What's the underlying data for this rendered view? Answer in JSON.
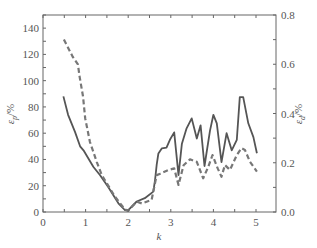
{
  "chart_data": {
    "type": "line",
    "title": "",
    "xlabel": "k",
    "ylabel_left": "εp/%",
    "ylabel_left_main": "ε",
    "ylabel_left_sub": "p",
    "ylabel_left_unit": "/%",
    "ylabel_right": "εd/%",
    "ylabel_right_main": "ε",
    "ylabel_right_sub": "d",
    "ylabel_right_unit": "/%",
    "xlim": [
      0,
      5.47
    ],
    "ylim_left": [
      0,
      150
    ],
    "ylim_right": [
      0,
      0.8
    ],
    "x_ticks": [
      0,
      1,
      2,
      3,
      4,
      5
    ],
    "x_tick_labels": [
      "0",
      "1",
      "2",
      "3",
      "4",
      "5"
    ],
    "y_left_ticks": [
      0,
      20,
      40,
      60,
      80,
      100,
      120,
      140
    ],
    "y_left_tick_labels": [
      "0",
      "20",
      "40",
      "60",
      "80",
      "100",
      "120",
      "140"
    ],
    "y_right_ticks": [
      0,
      0.2,
      0.4,
      0.6,
      0.8
    ],
    "y_right_tick_labels": [
      "0.0",
      "0.2",
      "0.4",
      "0.6",
      "0.8"
    ],
    "grid": false,
    "legend": null,
    "series": [
      {
        "name": "εp (left axis)",
        "axis": "left",
        "style": "solid",
        "color": "#555555",
        "x": [
          0.48,
          0.59,
          0.75,
          0.87,
          0.95,
          1.18,
          1.34,
          1.53,
          1.77,
          1.92,
          1.99,
          2.2,
          2.39,
          2.59,
          2.63,
          2.67,
          2.71,
          2.79,
          2.9,
          2.98,
          3.08,
          3.18,
          3.26,
          3.37,
          3.49,
          3.61,
          3.7,
          3.79,
          3.92,
          4.0,
          4.08,
          4.19,
          4.31,
          4.43,
          4.55,
          4.62,
          4.7,
          4.82,
          4.94,
          5.02
        ],
        "values": [
          88,
          74,
          61,
          50,
          47,
          34.5,
          28,
          19,
          6.6,
          1.5,
          1,
          8,
          10.5,
          15.5,
          24,
          36,
          44.6,
          48.5,
          49,
          55,
          60.6,
          28,
          52,
          63.7,
          71.3,
          56,
          66,
          35,
          62,
          74,
          67.5,
          38,
          60,
          47,
          55,
          87.5,
          87.5,
          67.5,
          57,
          44.7
        ]
      },
      {
        "name": "εd (right axis)",
        "axis": "right",
        "style": "dashed",
        "color": "#777777",
        "x": [
          0.49,
          0.7,
          0.82,
          0.86,
          0.94,
          0.99,
          1.1,
          1.26,
          1.38,
          1.45,
          1.69,
          1.92,
          2.0,
          2.2,
          2.32,
          2.55,
          2.63,
          2.67,
          2.75,
          2.94,
          3.08,
          3.18,
          3.3,
          3.45,
          3.61,
          3.76,
          3.88,
          3.98,
          4.1,
          4.19,
          4.27,
          4.39,
          4.55,
          4.66,
          4.74,
          4.86,
          5.02
        ],
        "values": [
          0.7,
          0.63,
          0.6,
          0.55,
          0.47,
          0.38,
          0.285,
          0.204,
          0.15,
          0.13,
          0.062,
          0.011,
          0.005,
          0.042,
          0.035,
          0.049,
          0.117,
          0.15,
          0.155,
          0.17,
          0.177,
          0.11,
          0.19,
          0.214,
          0.204,
          0.137,
          0.184,
          0.231,
          0.177,
          0.143,
          0.191,
          0.171,
          0.231,
          0.259,
          0.252,
          0.204,
          0.164
        ]
      }
    ]
  }
}
